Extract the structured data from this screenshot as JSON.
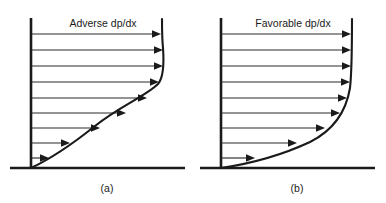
{
  "figure": {
    "background_color": "#ffffff",
    "ink_color": "#1a1a1a",
    "vector_color": "#2b2b2b",
    "width": 386,
    "height": 203
  },
  "panels": [
    {
      "id": "panel-a",
      "label": "Adverse dp/dx",
      "caption": "(a)",
      "label_x": 103,
      "label_y": 27,
      "caption_x": 107,
      "caption_y": 192,
      "wall_x": 31,
      "wall_top_y": 18,
      "baseline_y": 168,
      "baseline_x_start": 10,
      "baseline_x_end": 185,
      "profile_type": "s-curve-with-inflection",
      "profile_max_x": 162,
      "profile_path": "M 31 168 C 48 160 70 146 95 126 C 120 106 146 96 158 84 C 164 77 164 62 163 48 C 162 38 162 28 162 19",
      "arrow_count": 9,
      "arrows": [
        {
          "y": 34,
          "tip_x": 161
        },
        {
          "y": 50,
          "tip_x": 163
        },
        {
          "y": 66,
          "tip_x": 163
        },
        {
          "y": 82,
          "tip_x": 159
        },
        {
          "y": 98,
          "tip_x": 147
        },
        {
          "y": 113,
          "tip_x": 126
        },
        {
          "y": 128,
          "tip_x": 100
        },
        {
          "y": 143,
          "tip_x": 70
        },
        {
          "y": 158,
          "tip_x": 49
        }
      ]
    },
    {
      "id": "panel-b",
      "label": "Favorable dp/dx",
      "caption": "(b)",
      "label_x": 293,
      "label_y": 27,
      "caption_x": 297,
      "caption_y": 192,
      "wall_x": 221,
      "wall_top_y": 18,
      "baseline_y": 168,
      "baseline_x_start": 200,
      "baseline_x_end": 375,
      "profile_type": "convex-monotonic",
      "profile_max_x": 352,
      "profile_path": "M 221 168 C 248 164 280 156 310 142 C 334 130 346 112 350 88 C 352 70 352 40 352 19",
      "arrow_count": 9,
      "arrows": [
        {
          "y": 34,
          "tip_x": 351
        },
        {
          "y": 50,
          "tip_x": 351
        },
        {
          "y": 66,
          "tip_x": 351
        },
        {
          "y": 82,
          "tip_x": 350
        },
        {
          "y": 98,
          "tip_x": 347
        },
        {
          "y": 113,
          "tip_x": 340
        },
        {
          "y": 128,
          "tip_x": 325
        },
        {
          "y": 143,
          "tip_x": 297
        },
        {
          "y": 158,
          "tip_x": 255
        }
      ]
    }
  ]
}
